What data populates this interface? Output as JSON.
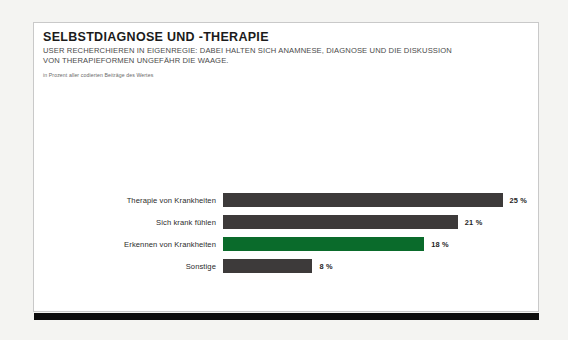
{
  "header": {
    "title": "SELBSTDIAGNOSE UND -THERAPIE",
    "subtitle_line1": "USER RECHERCHIEREN IN EIGENREGIE: DABEI HALTEN SICH ANAMNESE, DIAGNOSE UND DIE DISKUSSION",
    "subtitle_line2": "VON THERAPIEFORMEN UNGEFÄHR DIE WAAGE.",
    "source_note": "in Prozent aller codierten Beiträge des Wertes"
  },
  "colors": {
    "bar_default": "#3d3a3a",
    "bar_accent": "#0a6b2b",
    "card_background": "#ffffff",
    "page_background": "#f4f4f2",
    "rule": "#0d0d0d"
  },
  "chart_data": {
    "type": "bar",
    "orientation": "horizontal",
    "title": "SELBSTDIAGNOSE UND -THERAPIE",
    "subtitle": "USER RECHERCHIEREN IN EIGENREGIE: DABEI HALTEN SICH ANAMNESE, DIAGNOSE UND DIE DISKUSSION VON THERAPIEFORMEN UNGEFÄHR DIE WAAGE.",
    "xlabel": "",
    "ylabel": "",
    "unit": "%",
    "note": "in Prozent aller codierten Beiträge des Wertes",
    "grid": false,
    "legend": "none",
    "xlim": [
      0,
      28
    ],
    "categories": [
      "Therapie von Krankheiten",
      "Sich krank fühlen",
      "Erkennen von Krankheiten",
      "Sonstige"
    ],
    "values": [
      25,
      21,
      18,
      8
    ],
    "value_labels": [
      "25 %",
      "21 %",
      "18 %",
      "8 %"
    ],
    "highlight_index": 2,
    "bars": [
      {
        "label": "Therapie von Krankheiten",
        "value": 25,
        "value_label": "25 %",
        "highlight": false
      },
      {
        "label": "Sich krank fühlen",
        "value": 21,
        "value_label": "21 %",
        "highlight": false
      },
      {
        "label": "Erkennen von Krankheiten",
        "value": 18,
        "value_label": "18 %",
        "highlight": true
      },
      {
        "label": "Sonstige",
        "value": 8,
        "value_label": "8 %",
        "highlight": false
      }
    ]
  }
}
